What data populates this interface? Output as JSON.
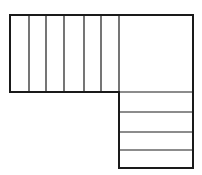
{
  "diagram": {
    "type": "l-shaped-stair-plan",
    "stroke_color": "#1a1a1a",
    "outline_width": 2,
    "tread_width": 1.2,
    "upper_flight": {
      "x": 10,
      "y": 15,
      "width": 109,
      "height": 77,
      "tread_lines_x": [
        29,
        46,
        64,
        84,
        101
      ]
    },
    "landing": {
      "x": 119,
      "y": 15,
      "width": 74,
      "height": 77
    },
    "lower_flight": {
      "x": 119,
      "y": 92,
      "width": 74,
      "height": 76,
      "tread_lines_y": [
        112,
        132,
        150
      ]
    }
  }
}
